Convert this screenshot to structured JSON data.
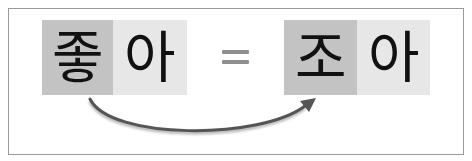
{
  "diagram": {
    "left_word": {
      "syllables": [
        "좋",
        "아"
      ],
      "highlighted_index": 0
    },
    "operator": "=",
    "right_word": {
      "syllables": [
        "조",
        "아"
      ],
      "highlighted_index": 0
    },
    "arrow": {
      "from": "좋",
      "to": "조",
      "color": "#555555"
    },
    "colors": {
      "highlight_box": "#c3c3c3",
      "plain_box": "#e7e7e7",
      "frame_border": "#9a9a9a",
      "equals_sign": "#8f8f8f"
    }
  }
}
